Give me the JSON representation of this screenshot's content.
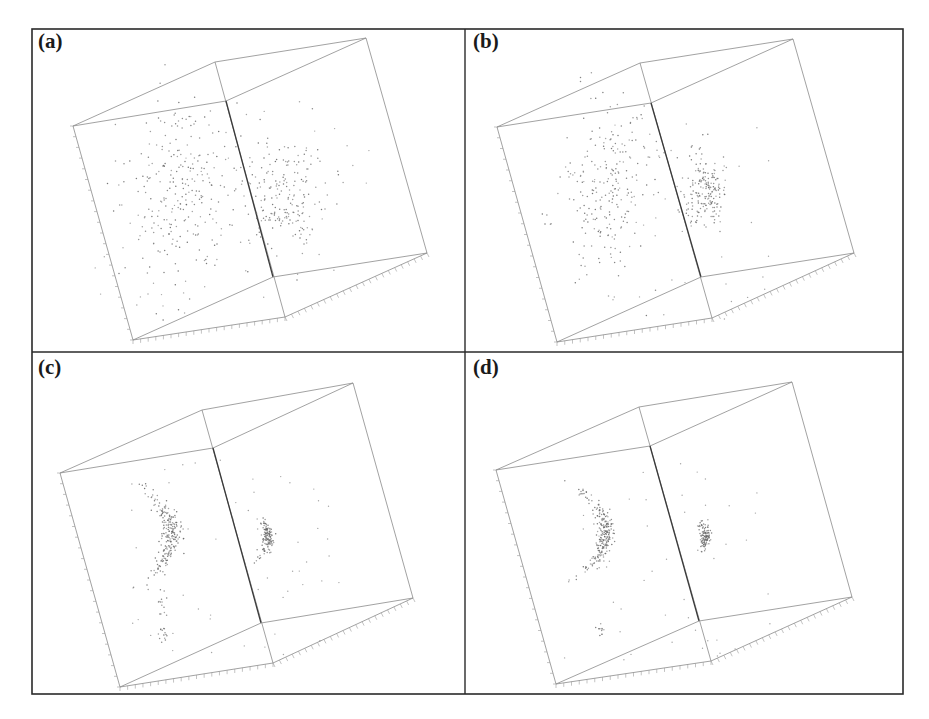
{
  "figure": {
    "frame": {
      "left": 32,
      "top": 29,
      "right": 903,
      "bottom": 694,
      "vdiv": 465,
      "hdiv": 352
    },
    "colors": {
      "frame": "#2a2a2a",
      "cube": "#8a8a8a",
      "cube_front": "#3a3a3a",
      "points": "#6a6a6a",
      "ticks": "#9a9a9a"
    }
  },
  "chart_data": [
    {
      "type": "scatter",
      "title": "(a)",
      "panel_label": "(a)",
      "label_pos": [
        38,
        31
      ],
      "projection": "3d-box",
      "grid": false,
      "description": "Two diffuse clusters, wide spread on left face and right face",
      "cube": {
        "v": [
          [
            73,
            126
          ],
          [
            215,
            62
          ],
          [
            366,
            38
          ],
          [
            226,
            101
          ],
          [
            427,
            253
          ],
          [
            273,
            277
          ],
          [
            285,
            317
          ],
          [
            133,
            340
          ]
        ]
      },
      "clusters": [
        {
          "cx": 185,
          "cy": 195,
          "sx": 30,
          "sy": 45,
          "n": 260,
          "arc": 0
        },
        {
          "cx": 283,
          "cy": 195,
          "sx": 20,
          "sy": 30,
          "n": 200,
          "arc": 0
        }
      ],
      "noise": {
        "n": 40,
        "box": [
          95,
          110,
          380,
          320
        ]
      }
    },
    {
      "type": "scatter",
      "title": "(b)",
      "panel_label": "(b)",
      "label_pos": [
        473,
        31
      ],
      "projection": "3d-box",
      "grid": false,
      "description": "Clusters tightening relative to (a)",
      "cube": {
        "v": [
          [
            497,
            127
          ],
          [
            640,
            63
          ],
          [
            793,
            39
          ],
          [
            651,
            103
          ],
          [
            854,
            253
          ],
          [
            701,
            277
          ],
          [
            712,
            318
          ],
          [
            557,
            342
          ]
        ]
      },
      "clusters": [
        {
          "cx": 608,
          "cy": 185,
          "sx": 24,
          "sy": 42,
          "n": 230,
          "arc": 0
        },
        {
          "cx": 706,
          "cy": 190,
          "sx": 11,
          "sy": 20,
          "n": 190,
          "arc": 0
        }
      ],
      "noise": {
        "n": 45,
        "box": [
          560,
          120,
          770,
          320
        ]
      }
    },
    {
      "type": "scatter",
      "title": "(c)",
      "panel_label": "(c)",
      "label_pos": [
        38,
        357
      ],
      "projection": "3d-box",
      "grid": false,
      "description": "Points collapsed onto arc-shaped clusters",
      "cube": {
        "v": [
          [
            60,
            473
          ],
          [
            202,
            410
          ],
          [
            353,
            383
          ],
          [
            213,
            448
          ],
          [
            413,
            598
          ],
          [
            261,
            623
          ],
          [
            273,
            663
          ],
          [
            120,
            687
          ]
        ]
      },
      "clusters": [
        {
          "cx": 172,
          "cy": 535,
          "sx": 5,
          "sy": 22,
          "n": 220,
          "arc": 0.012
        },
        {
          "cx": 268,
          "cy": 537,
          "sx": 3,
          "sy": 9,
          "n": 130,
          "arc": 0.02
        },
        {
          "cx": 162,
          "cy": 603,
          "sx": 3,
          "sy": 8,
          "n": 14,
          "arc": 0
        },
        {
          "cx": 163,
          "cy": 635,
          "sx": 3,
          "sy": 5,
          "n": 14,
          "arc": 0
        }
      ],
      "noise": {
        "n": 55,
        "box": [
          130,
          460,
          340,
          660
        ]
      }
    },
    {
      "type": "scatter",
      "title": "(d)",
      "panel_label": "(d)",
      "label_pos": [
        473,
        357
      ],
      "projection": "3d-box",
      "grid": false,
      "description": "Further compacted arc clusters",
      "cube": {
        "v": [
          [
            496,
            470
          ],
          [
            639,
            407
          ],
          [
            792,
            382
          ],
          [
            650,
            446
          ],
          [
            852,
            597
          ],
          [
            699,
            621
          ],
          [
            711,
            661
          ],
          [
            556,
            684
          ]
        ]
      },
      "clusters": [
        {
          "cx": 606,
          "cy": 532,
          "sx": 4,
          "sy": 20,
          "n": 230,
          "arc": 0.014
        },
        {
          "cx": 706,
          "cy": 536,
          "sx": 2.5,
          "sy": 8,
          "n": 110,
          "arc": 0.02
        },
        {
          "cx": 601,
          "cy": 630,
          "sx": 2,
          "sy": 4,
          "n": 10,
          "arc": 0
        }
      ],
      "noise": {
        "n": 45,
        "box": [
          560,
          460,
          780,
          660
        ]
      }
    }
  ]
}
